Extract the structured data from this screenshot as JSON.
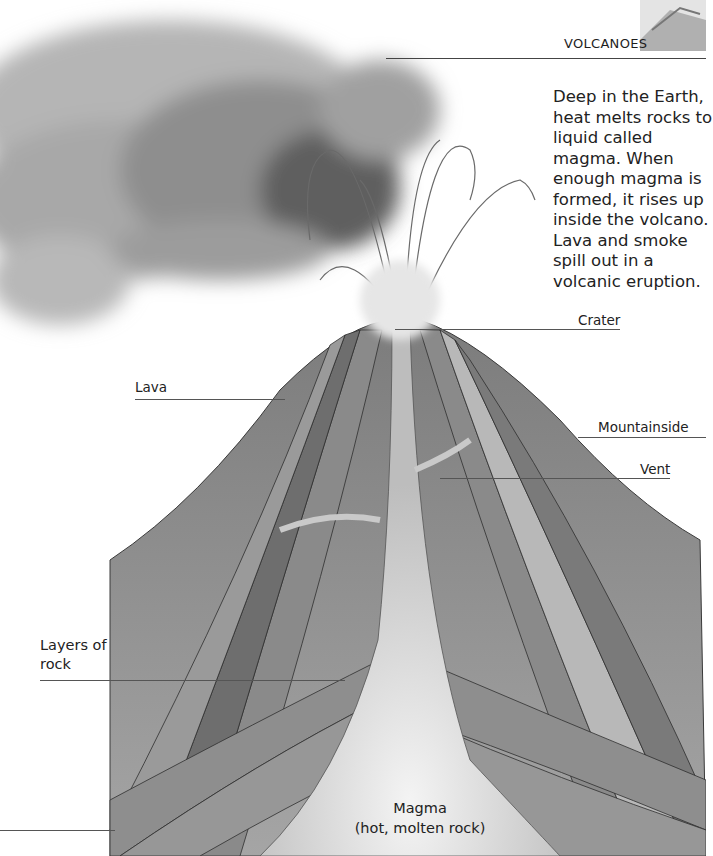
{
  "header": {
    "section_title": "VOLCANOES",
    "thumbnail_icon": "volcano-thumbnail-icon"
  },
  "intro": {
    "text": "Deep in the Earth, heat melts rocks to liquid called magma. When enough magma is formed, it rises up inside the volcano. Lava and smoke spill out in a volcanic eruption."
  },
  "labels": {
    "crater": "Crater",
    "lava": "Lava",
    "mountainside": "Mountainside",
    "vent": "Vent",
    "layers_of_rock": "Layers of rock",
    "magma_title": "Magma",
    "magma_subtitle": "(hot, molten rock)"
  },
  "colors": {
    "background": "#ffffff",
    "text": "#222222",
    "smoke_dark": "#5a5a5a",
    "smoke_light": "#c8c8c8",
    "mountain": "#8f8f8f",
    "layer_dark": "#6e6e6e",
    "layer_mid": "#8c8c8c",
    "layer_light": "#b4b4b4",
    "magma": "#d9d9d9"
  }
}
